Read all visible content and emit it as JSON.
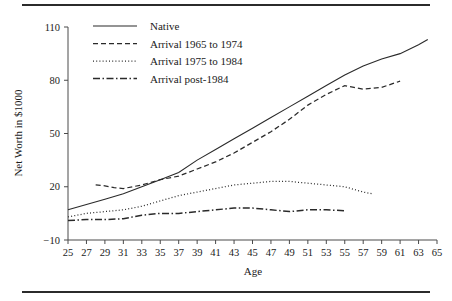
{
  "figure": {
    "top_rule": "horizontal-rule",
    "bottom_rule": "horizontal-rule"
  },
  "chart_data": {
    "type": "line",
    "title": "",
    "xlabel": "Age",
    "ylabel": "Net Worth in $1000",
    "xlim": [
      25,
      65
    ],
    "ylim": [
      -10,
      110
    ],
    "yticks": [
      -10,
      20,
      50,
      80,
      110
    ],
    "ytick_labels": [
      "−10",
      "20",
      "50",
      "80",
      "110"
    ],
    "xticks": [
      25,
      27,
      29,
      31,
      33,
      35,
      37,
      39,
      41,
      43,
      45,
      47,
      49,
      51,
      53,
      55,
      57,
      59,
      61,
      63,
      65
    ],
    "xtick_labels": [
      "25",
      "27",
      "29",
      "31",
      "33",
      "35",
      "37",
      "39",
      "41",
      "43",
      "45",
      "47",
      "49",
      "51",
      "53",
      "55",
      "57",
      "59",
      "61",
      "63",
      "65"
    ],
    "grid": false,
    "legend_position": "upper left",
    "series": [
      {
        "name": "Native",
        "style": "solid",
        "x": [
          25,
          27,
          29,
          31,
          33,
          35,
          37,
          39,
          41,
          43,
          45,
          47,
          49,
          51,
          53,
          55,
          57,
          59,
          61,
          63,
          64
        ],
        "values": [
          7,
          10,
          13,
          16,
          20,
          24,
          28,
          35,
          41,
          47,
          53,
          59,
          65,
          71,
          77,
          83,
          88,
          92,
          95,
          100,
          103
        ]
      },
      {
        "name": "Arrival 1965 to 1974",
        "style": "dashed",
        "x": [
          28,
          29,
          30,
          31,
          32,
          33,
          34,
          35,
          37,
          39,
          41,
          43,
          45,
          47,
          49,
          51,
          53,
          55,
          56,
          57,
          59,
          61
        ],
        "values": [
          21,
          20.5,
          19.5,
          19,
          20,
          21,
          22.5,
          24,
          26,
          30,
          34,
          39,
          45,
          51,
          58,
          66,
          72,
          77,
          76,
          75,
          76,
          79.5
        ]
      },
      {
        "name": "Arrival 1975 to 1984",
        "style": "dotted",
        "x": [
          25,
          27,
          29,
          31,
          33,
          35,
          37,
          39,
          41,
          43,
          45,
          47,
          49,
          51,
          53,
          55,
          57,
          58
        ],
        "values": [
          3,
          5,
          6,
          7,
          9,
          12,
          15,
          17,
          19,
          21,
          22,
          23,
          23,
          22,
          21,
          20,
          17,
          16
        ]
      },
      {
        "name": "Arrival post-1984",
        "style": "dashdot",
        "x": [
          25,
          27,
          29,
          31,
          33,
          35,
          37,
          39,
          41,
          43,
          45,
          47,
          49,
          51,
          53,
          55
        ],
        "values": [
          1,
          1.5,
          1.5,
          2,
          4,
          5,
          5,
          6,
          7,
          8,
          8,
          7,
          6,
          7,
          7,
          6.5
        ]
      }
    ]
  },
  "legend": {
    "entries": [
      {
        "label": "Native",
        "style": "solid"
      },
      {
        "label": "Arrival 1965 to 1974",
        "style": "dashed"
      },
      {
        "label": "Arrival 1975 to 1984",
        "style": "dotted"
      },
      {
        "label": "Arrival post-1984",
        "style": "dashdot"
      }
    ]
  }
}
